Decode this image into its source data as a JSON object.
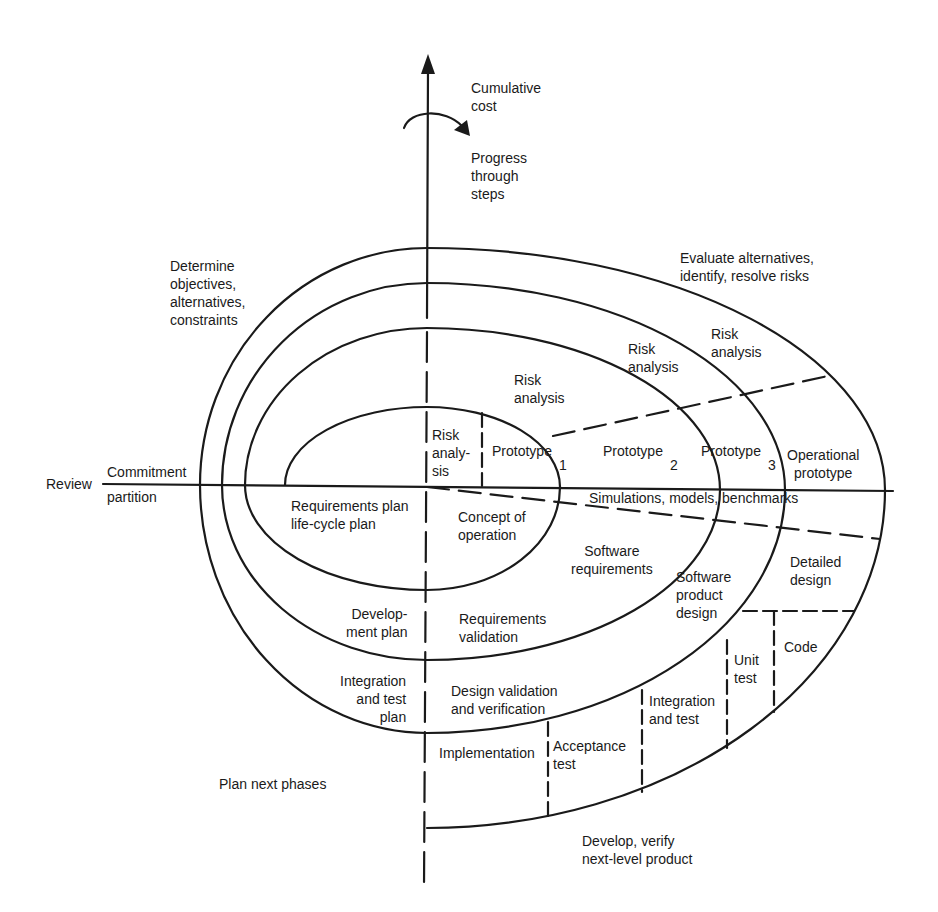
{
  "diagram": {
    "colors": {
      "ink": "#1a1a1a",
      "background": "#ffffff"
    },
    "axes": {
      "vertical_label": "Cumulative\ncost",
      "rotation_label": "Progress\nthrough\nsteps",
      "review_label": "Review",
      "commitment_label": "Commitment",
      "partition_label": "partition"
    },
    "quadrants": {
      "top_left": "Determine\nobjectives,\nalternatives,\nconstraints",
      "top_right": "Evaluate alternatives,\nidentify, resolve risks",
      "bottom_left": "Plan next phases",
      "bottom_right": "Develop, verify\nnext-level product"
    },
    "risk_analysis": [
      "Risk\nanaly-\nsis",
      "Risk\nanalysis",
      "Risk\nanalysis",
      "Risk\nanalysis"
    ],
    "prototypes": [
      {
        "label": "Prototype",
        "index": "1"
      },
      {
        "label": "Prototype",
        "index": "2"
      },
      {
        "label": "Prototype",
        "index": "3"
      },
      {
        "label": "Operational\nprototype",
        "index": ""
      }
    ],
    "simulations": "Simulations, models, benchmarks",
    "plans": [
      "Requirements plan\nlife-cycle plan",
      "Develop-\nment plan",
      "Integration\nand test\nplan"
    ],
    "development": [
      "Concept of\noperation",
      "Software\nrequirements",
      "Software\nproduct\ndesign",
      "Detailed\ndesign",
      "Code",
      "Unit\ntest",
      "Integration\nand test",
      "Acceptance\ntest",
      "Implementation"
    ],
    "validation": [
      "Requirements\nvalidation",
      "Design validation\nand verification"
    ]
  }
}
